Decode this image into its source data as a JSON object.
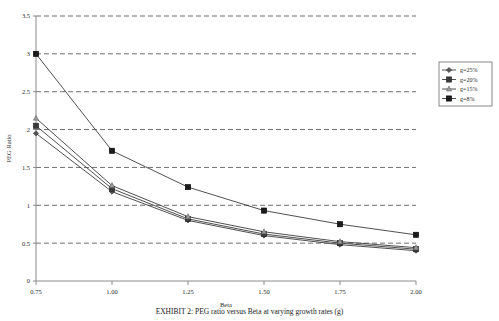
{
  "chart_data": {
    "type": "line",
    "title": "",
    "xlabel": "Beta",
    "ylabel": "PEG Ratio",
    "x": [
      0.75,
      1.0,
      1.25,
      1.5,
      1.75,
      2.0
    ],
    "xticklabels": [
      "0.75",
      "1.00",
      "1.25",
      "1.50",
      "1.75",
      "2.00"
    ],
    "yticklabels": [
      "0",
      "0.5",
      "1",
      "1.5",
      "2",
      "2.5",
      "3",
      "3.5"
    ],
    "yticks": [
      0,
      0.5,
      1,
      1.5,
      2,
      2.5,
      3,
      3.5
    ],
    "xlim": [
      0.75,
      2.0
    ],
    "ylim": [
      0,
      3.5
    ],
    "grid": "horizontal-dashed",
    "legend_position": "upper-right-outside",
    "series": [
      {
        "name": "g=25%",
        "marker": "diamond",
        "values": [
          1.95,
          1.18,
          0.8,
          0.6,
          0.48,
          0.4
        ]
      },
      {
        "name": "g=20%",
        "marker": "square",
        "values": [
          2.05,
          1.22,
          0.82,
          0.62,
          0.5,
          0.42
        ]
      },
      {
        "name": "g=15%",
        "marker": "triangle",
        "values": [
          2.15,
          1.26,
          0.85,
          0.65,
          0.52,
          0.44
        ]
      },
      {
        "name": "g=8%",
        "marker": "square-dark",
        "values": [
          3.0,
          1.72,
          1.24,
          0.93,
          0.75,
          0.61
        ]
      }
    ]
  },
  "caption": {
    "text": "EXHIBIT 2: PEG ratio versus Beta at varying growth rates (g)"
  }
}
